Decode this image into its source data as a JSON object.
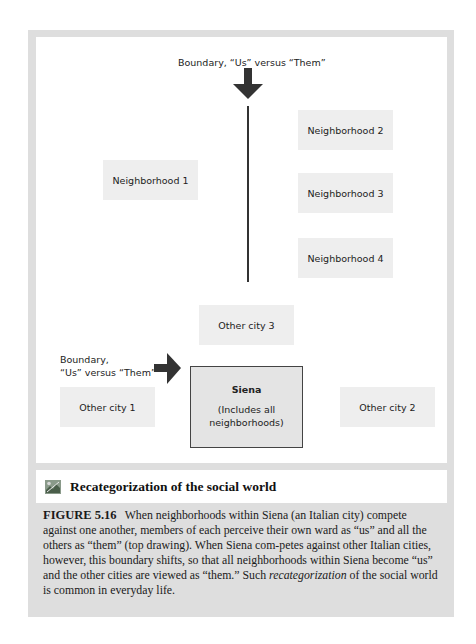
{
  "diagram": {
    "top_boundary_label": "Boundary, “Us” versus “Them”",
    "neighborhoods": [
      {
        "label": "Neighborhood 1"
      },
      {
        "label": "Neighborhood 2"
      },
      {
        "label": "Neighborhood 3"
      },
      {
        "label": "Neighborhood 4"
      }
    ],
    "bottom_boundary_label_line1": "Boundary,",
    "bottom_boundary_label_line2": "“Us” versus “Them”",
    "cities": [
      {
        "label": "Other city 1"
      },
      {
        "label": "Other city 2"
      },
      {
        "label": "Other city 3"
      }
    ],
    "siena": {
      "name": "Siena",
      "subtitle_line1": "(Includes all",
      "subtitle_line2": "neighborhoods)"
    },
    "colors": {
      "frame": "#dedede",
      "box_fill": "#eeeeee",
      "arrow": "#333333"
    }
  },
  "title_bar": {
    "icon": "figure-thumbnail-icon",
    "title": "Recategorization of the social world"
  },
  "caption": {
    "figure_number": "FIGURE 5.16",
    "text_before_italic": "When neighborhoods within Siena (an Italian city) compete against one another, members of each perceive their own ward as “us” and all the others as “them” (top drawing). When Siena com-petes against other Italian cities, however, this boundary shifts, so that all neighborhoods within Siena become “us” and the other cities are viewed as “them.” Such ",
    "italic_term": "recategorization",
    "text_after_italic": " of the social world is common in everyday life."
  }
}
